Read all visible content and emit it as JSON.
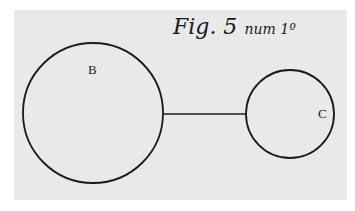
{
  "figure": {
    "title_main": "Fig. 5",
    "title_sub": "num 1º",
    "labels": {
      "large_circle": "B",
      "small_circle": "C"
    },
    "elements": [
      {
        "id": "circle-B",
        "type": "circle",
        "label": "B"
      },
      {
        "id": "circle-C",
        "type": "circle",
        "label": "C"
      },
      {
        "id": "connector",
        "type": "line",
        "from": "circle-B",
        "to": "circle-C"
      }
    ],
    "colors": {
      "background": "#e9e9e9",
      "ink": "#1a1a1a"
    }
  }
}
